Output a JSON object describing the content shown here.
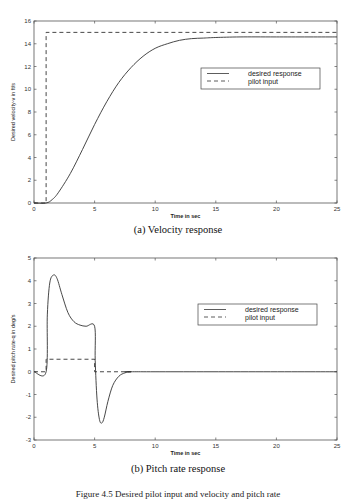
{
  "chart_data": [
    {
      "type": "line",
      "title": "(a) Velocity response",
      "xlabel": "Time in sec",
      "ylabel": "Desired velocity-v in ft/s",
      "xlim": [
        0,
        25
      ],
      "ylim": [
        0,
        16
      ],
      "xticks": [
        0,
        5,
        10,
        15,
        20,
        25
      ],
      "yticks": [
        0,
        2,
        4,
        6,
        8,
        10,
        12,
        14,
        16
      ],
      "grid": false,
      "legend_position": "upper right (inside)",
      "series": [
        {
          "name": "desired response",
          "style": "solid",
          "x": [
            0,
            1,
            1.5,
            2,
            3,
            4,
            5,
            6,
            7,
            8,
            9,
            10,
            11,
            12,
            13,
            14,
            15,
            17,
            20,
            25
          ],
          "y": [
            0,
            0,
            0.3,
            0.9,
            2.6,
            4.7,
            6.9,
            8.9,
            10.6,
            11.9,
            12.9,
            13.6,
            14.0,
            14.3,
            14.45,
            14.5,
            14.55,
            14.6,
            14.6,
            14.6
          ]
        },
        {
          "name": "pilot input",
          "style": "dashed",
          "x": [
            0,
            1,
            1,
            25
          ],
          "y": [
            0,
            0,
            15,
            15
          ]
        }
      ]
    },
    {
      "type": "line",
      "title": "(b) Pitch rate response",
      "xlabel": "Time in sec",
      "ylabel": "Desired pitch rate-q in deg/s",
      "xlim": [
        0,
        25
      ],
      "ylim": [
        -3,
        5
      ],
      "xticks": [
        0,
        5,
        10,
        15,
        20,
        25
      ],
      "yticks": [
        -3,
        -2,
        -1,
        0,
        1,
        2,
        3,
        4,
        5
      ],
      "grid": false,
      "legend_position": "upper right (inside)",
      "series": [
        {
          "name": "desired response",
          "style": "solid",
          "x": [
            0,
            1,
            1.1,
            1.3,
            1.6,
            1.9,
            2.3,
            2.8,
            3.3,
            3.8,
            4.3,
            5.0,
            5.05,
            5.2,
            5.4,
            5.6,
            5.8,
            6.1,
            6.5,
            7.0,
            7.5,
            8.0,
            9,
            25
          ],
          "y": [
            0,
            0,
            2.5,
            3.9,
            4.25,
            4.1,
            3.4,
            2.6,
            2.2,
            2.05,
            2.0,
            2.0,
            0.5,
            -1.2,
            -2.1,
            -2.25,
            -2.0,
            -1.3,
            -0.6,
            -0.2,
            -0.05,
            0,
            0,
            0
          ]
        },
        {
          "name": "pilot input",
          "style": "dashed",
          "x": [
            0,
            1,
            1,
            5,
            5,
            8
          ],
          "y": [
            0,
            0,
            0.55,
            0.55,
            0,
            0
          ]
        }
      ]
    }
  ],
  "figure_a": {
    "ylabel": "Desired velocity-v in ft/s",
    "xlabel": "Time in sec",
    "caption": "(a) Velocity response",
    "legend": [
      "desired response",
      "pilot input"
    ],
    "xticks": [
      "0",
      "5",
      "10",
      "15",
      "20",
      "25"
    ],
    "yticks": [
      "0",
      "2",
      "4",
      "6",
      "8",
      "10",
      "12",
      "14",
      "16"
    ]
  },
  "figure_b": {
    "ylabel": "Desired pitch rate-q in deg/s",
    "xlabel": "Time in sec",
    "caption": "(b) Pitch rate response",
    "legend": [
      "desired response",
      "pilot input"
    ],
    "xticks": [
      "0",
      "5",
      "10",
      "15",
      "20",
      "25"
    ],
    "yticks": [
      "-3",
      "-2",
      "-1",
      "0",
      "1",
      "2",
      "3",
      "4",
      "5"
    ]
  },
  "figure_caption": "Figure 4.5   Desired pilot input and velocity and pitch rate"
}
